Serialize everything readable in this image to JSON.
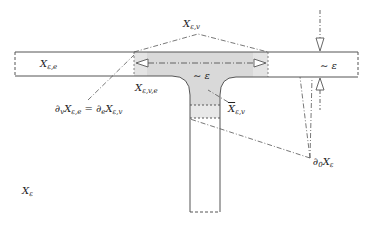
{
  "diagram": {
    "labels": {
      "x_e_e_base": "X",
      "x_e_e_sub": "ε,e",
      "x_e_v_base": "X",
      "x_e_v_sub": "ε,v",
      "x_e_v_e_base": "X",
      "x_e_v_e_sub": "ε,v,e",
      "eps_junction": "∼ ε",
      "eps_right": "∼ ε",
      "x_e_v_bar_base": "X",
      "x_e_v_bar_sub": "ε,v",
      "boundary_eq_lhs_partial": "∂",
      "boundary_eq_lhs_partial_sub": "v",
      "boundary_eq_lhs_base": "X",
      "boundary_eq_lhs_sub": "ε,e",
      "boundary_eq_equals": " = ",
      "boundary_eq_rhs_partial": "∂",
      "boundary_eq_rhs_partial_sub": "e",
      "boundary_eq_rhs_base": "X",
      "boundary_eq_rhs_sub": "ε,v",
      "d0_partial": "∂",
      "d0_partial_sub": "0",
      "d0_base": "X",
      "d0_sub": "ε",
      "x_eps_base": "X",
      "x_eps_sub": "ε"
    },
    "colors": {
      "stroke": "#555555",
      "shade": "#d9d9d9",
      "light_shade": "#ececec",
      "background": "#ffffff"
    }
  }
}
